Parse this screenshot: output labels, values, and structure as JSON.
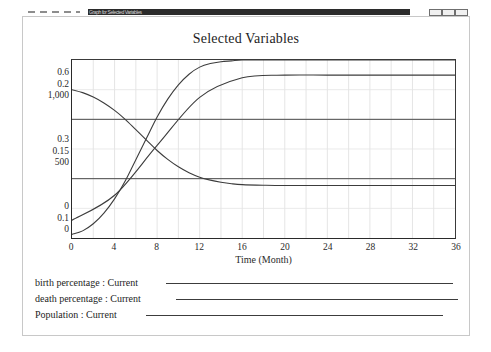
{
  "window": {
    "title": "Graph for Selected Variables",
    "buttons": {
      "minimize": "minimize-button",
      "restore": "restore-button",
      "close": "close-button"
    }
  },
  "chart_data": {
    "type": "line",
    "title": "Selected Variables",
    "xlabel": "Time (Month)",
    "ylabel": "",
    "grid": true,
    "legend_position": "bottom",
    "xlim": [
      0,
      36
    ],
    "xticks": [
      "0",
      "4",
      "8",
      "12",
      "16",
      "20",
      "24",
      "28",
      "32",
      "36"
    ],
    "xtick_values": [
      0,
      4,
      8,
      12,
      16,
      20,
      24,
      28,
      32,
      36
    ],
    "y_axes": [
      {
        "name": "birth percentage",
        "ticks": [
          "0.6",
          "0.3",
          "0"
        ],
        "tick_values": [
          0.6,
          0.3,
          0
        ],
        "ylim": [
          0,
          0.6
        ]
      },
      {
        "name": "death percentage",
        "ticks": [
          "0.2",
          "0.15",
          "0.1"
        ],
        "tick_values": [
          0.2,
          0.15,
          0.1
        ],
        "ylim": [
          0.1,
          0.2
        ]
      },
      {
        "name": "Population",
        "ticks": [
          "1,000",
          "500",
          "0"
        ],
        "tick_values": [
          1000,
          500,
          0
        ],
        "ylim": [
          0,
          1000
        ]
      }
    ],
    "series": [
      {
        "name": "birth percentage : Current",
        "axis": 0,
        "color": "#3c3c3c",
        "x": [
          0,
          1,
          2,
          3,
          4,
          5,
          6,
          7,
          8,
          9,
          10,
          11,
          12,
          13,
          14,
          15,
          16,
          18,
          20,
          24,
          28,
          32,
          36
        ],
        "values": [
          0.5,
          0.49,
          0.475,
          0.455,
          0.43,
          0.4,
          0.365,
          0.33,
          0.295,
          0.265,
          0.24,
          0.22,
          0.205,
          0.195,
          0.188,
          0.183,
          0.18,
          0.178,
          0.177,
          0.177,
          0.177,
          0.177,
          0.177
        ]
      },
      {
        "name": "death percentage : Current",
        "axis": 1,
        "color": "#3c3c3c",
        "x": [
          0,
          1,
          2,
          3,
          4,
          5,
          6,
          7,
          8,
          9,
          10,
          11,
          12,
          13,
          14,
          15,
          16,
          18,
          20,
          24,
          28,
          32,
          36
        ],
        "values": [
          0.102,
          0.104,
          0.108,
          0.114,
          0.122,
          0.132,
          0.144,
          0.156,
          0.168,
          0.178,
          0.186,
          0.192,
          0.196,
          0.198,
          0.199,
          0.1995,
          0.2,
          0.2,
          0.2,
          0.2,
          0.2,
          0.2,
          0.2
        ]
      },
      {
        "name": "Population : Current",
        "axis": 2,
        "color": "#3c3c3c",
        "x": [
          0,
          4,
          8,
          12,
          16,
          20,
          24,
          28,
          32,
          36
        ],
        "values": [
          100,
          240,
          520,
          790,
          900,
          915,
          915,
          915,
          915,
          915
        ]
      }
    ]
  },
  "legend": {
    "entries": [
      {
        "label": "birth percentage : Current"
      },
      {
        "label": "death percentage : Current"
      },
      {
        "label": "Population : Current"
      }
    ]
  },
  "axes_labels": {
    "y_top": {
      "a": "0.6",
      "b": "0.2",
      "c": "1,000"
    },
    "y_middle": {
      "a": "0.3",
      "b": "0.15",
      "c": "500"
    },
    "y_bottom": {
      "a": "0",
      "b": "0.1",
      "c": "0"
    }
  }
}
